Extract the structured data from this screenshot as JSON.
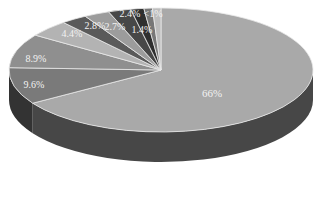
{
  "chart_data": {
    "type": "pie",
    "style": "3d",
    "title": "",
    "legend": "none",
    "slices": [
      {
        "label": "66%",
        "value": 66.0,
        "color": "#a9a9a9"
      },
      {
        "label": "9.6%",
        "value": 9.6,
        "color": "#7a7a7a"
      },
      {
        "label": "8.9%",
        "value": 8.9,
        "color": "#8f8f8f"
      },
      {
        "label": "4.4%",
        "value": 4.4,
        "color": "#b3b3b3"
      },
      {
        "label": "2.8%",
        "value": 2.8,
        "color": "#5a5a5a"
      },
      {
        "label": "2.7%",
        "value": 2.7,
        "color": "#9c9c9c"
      },
      {
        "label": "2.4%",
        "value": 2.4,
        "color": "#474747"
      },
      {
        "label": "1.4%",
        "value": 1.4,
        "color": "#2f2f2f"
      },
      {
        "label": "<1%",
        "value": 0.9,
        "color": "#777777"
      },
      {
        "label": "<1%",
        "value": 0.9,
        "color": "#bdbdbd"
      }
    ]
  }
}
